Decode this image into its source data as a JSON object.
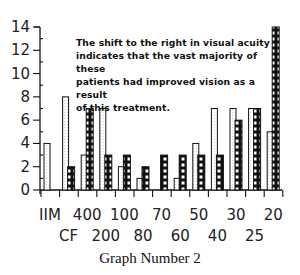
{
  "chart_data": {
    "type": "bar",
    "title": "",
    "caption": "Graph Number 2",
    "xlabel": "Visual acuity",
    "ylabel": "Number of patients",
    "ylim": [
      0,
      14
    ],
    "yticks": [
      0,
      2,
      4,
      6,
      8,
      10,
      12,
      14
    ],
    "grid": false,
    "categories": [
      "IIM",
      "CF",
      "400",
      "200",
      "100",
      "80",
      "70",
      "60",
      "50",
      "40",
      "30",
      "25",
      "20"
    ],
    "x_label_rows": {
      "top": [
        "IIM",
        "400",
        "100",
        "70",
        "50",
        "30",
        "20"
      ],
      "bottom": [
        "CF",
        "200",
        "80",
        "60",
        "40",
        "25"
      ]
    },
    "series": [
      {
        "name": "Before treatment",
        "pattern": "white",
        "values": [
          4,
          8,
          3,
          7,
          2,
          1,
          0,
          1,
          4,
          7,
          7,
          7,
          5
        ]
      },
      {
        "name": "After treatment",
        "pattern": "checkered",
        "values": [
          0,
          2,
          7,
          3,
          3,
          2,
          3,
          3,
          3,
          3,
          6,
          7,
          14
        ]
      }
    ],
    "annotation": "The shift to the right in visual acuity indicates that the vast majority of these patients had improved vision as a result of this treatment."
  },
  "annotation_lines": [
    "The shift to the right in visual acuity",
    "indicates that the vast majority of these",
    "patients had improved vision as a result",
    "of this treatment."
  ],
  "caption": "Graph Number 2"
}
